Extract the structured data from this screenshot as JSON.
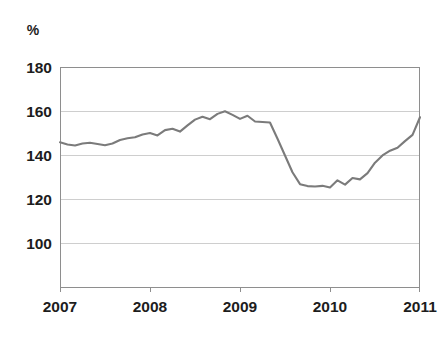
{
  "chart_data": {
    "type": "line",
    "title": "",
    "subtitle": "",
    "xlabel": "",
    "ylabel": "%",
    "unit_label": "%",
    "grid": true,
    "legend": false,
    "legend_position": "none",
    "xlim": [
      2007.0,
      2011.0
    ],
    "ylim": [
      88,
      180
    ],
    "yticks": [
      100,
      120,
      140,
      160,
      180
    ],
    "ytick_labels": [
      "100",
      "120",
      "140",
      "160",
      "180"
    ],
    "xticks": [
      2007,
      2008,
      2009,
      2010,
      2011
    ],
    "xtick_labels": [
      "2007",
      "2008",
      "2009",
      "2010",
      "2011"
    ],
    "series": [
      {
        "name": "index",
        "color": "#7b7b7b",
        "x": [
          2007.0,
          2007.083,
          2007.167,
          2007.25,
          2007.333,
          2007.417,
          2007.5,
          2007.583,
          2007.667,
          2007.75,
          2007.833,
          2007.917,
          2008.0,
          2008.083,
          2008.167,
          2008.25,
          2008.333,
          2008.417,
          2008.5,
          2008.583,
          2008.667,
          2008.75,
          2008.833,
          2008.917,
          2009.0,
          2009.083,
          2009.167,
          2009.25,
          2009.333,
          2009.417,
          2009.5,
          2009.583,
          2009.667,
          2009.75,
          2009.833,
          2009.917,
          2010.0,
          2010.083,
          2010.167,
          2010.25,
          2010.333,
          2010.417,
          2010.5,
          2010.583,
          2010.667,
          2010.75,
          2010.833,
          2010.917,
          2011.0
        ],
        "values": [
          148.5,
          147.6,
          147.2,
          148.0,
          148.3,
          147.8,
          147.3,
          148.0,
          149.5,
          150.2,
          150.6,
          151.8,
          152.4,
          151.4,
          153.6,
          154.2,
          153.0,
          155.6,
          158.0,
          159.2,
          158.2,
          160.4,
          161.5,
          160.0,
          158.3,
          159.6,
          157.2,
          157.0,
          156.8,
          150.0,
          143.0,
          136.0,
          131.0,
          130.2,
          130.0,
          130.3,
          129.6,
          132.6,
          130.8,
          133.6,
          133.0,
          135.6,
          140.0,
          143.0,
          145.0,
          146.2,
          149.0,
          151.6,
          159.0
        ]
      }
    ],
    "annotations": []
  }
}
